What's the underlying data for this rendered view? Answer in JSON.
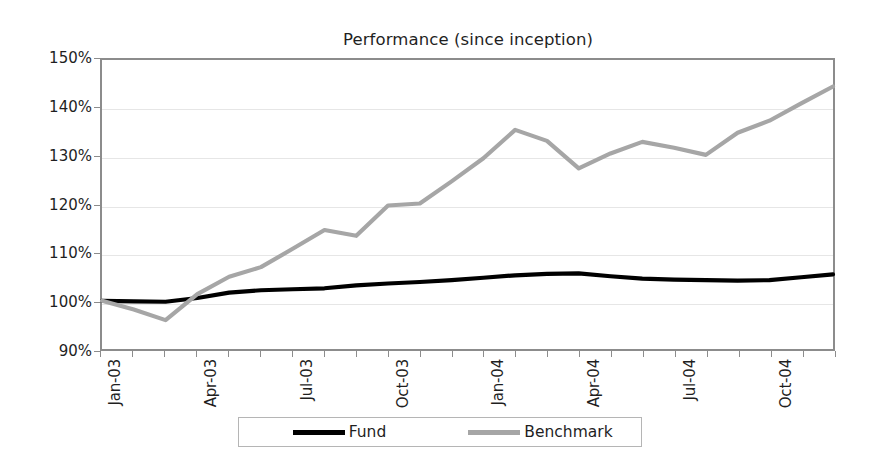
{
  "chart_data": {
    "type": "line",
    "title": "Performance (since inception)",
    "xlabel": "",
    "ylabel": "",
    "ylim": [
      90,
      150
    ],
    "ytick_values": [
      90,
      100,
      110,
      120,
      130,
      140,
      150
    ],
    "ytick_labels": [
      "90%",
      "100%",
      "110%",
      "120%",
      "130%",
      "140%",
      "150%"
    ],
    "grid": true,
    "legend_position": "bottom",
    "x": [
      "Jan-03",
      "Feb-03",
      "Mar-03",
      "Apr-03",
      "May-03",
      "Jun-03",
      "Jul-03",
      "Aug-03",
      "Sep-03",
      "Oct-03",
      "Nov-03",
      "Dec-03",
      "Jan-04",
      "Feb-04",
      "Mar-04",
      "Apr-04",
      "May-04",
      "Jun-04",
      "Jul-04",
      "Aug-04",
      "Sep-04",
      "Oct-04",
      "Nov-04",
      "Dec-04"
    ],
    "xtick_labels": [
      "Jan-03",
      "Apr-03",
      "Jul-03",
      "Oct-03",
      "Jan-04",
      "Apr-04",
      "Jul-04",
      "Oct-04"
    ],
    "xtick_indices": [
      0,
      3,
      6,
      9,
      12,
      15,
      18,
      21
    ],
    "series": [
      {
        "name": "Fund",
        "color": "#000000",
        "values": [
          100.0,
          99.9,
          99.8,
          100.6,
          101.7,
          102.2,
          102.4,
          102.6,
          103.2,
          103.6,
          103.9,
          104.3,
          104.8,
          105.3,
          105.6,
          105.7,
          105.1,
          104.6,
          104.4,
          104.3,
          104.2,
          104.3,
          104.9,
          105.5
        ]
      },
      {
        "name": "Benchmark",
        "color": "#a6a6a6",
        "values": [
          100.0,
          98.2,
          96.0,
          101.4,
          105.0,
          107.0,
          110.8,
          114.7,
          113.5,
          119.8,
          120.2,
          124.8,
          129.6,
          135.5,
          133.2,
          127.5,
          130.6,
          133.0,
          131.8,
          130.3,
          134.9,
          137.4,
          141.0,
          144.5
        ]
      }
    ]
  },
  "legend": {
    "entries": [
      {
        "label": "Fund",
        "color": "#000000"
      },
      {
        "label": "Benchmark",
        "color": "#a6a6a6"
      }
    ]
  }
}
